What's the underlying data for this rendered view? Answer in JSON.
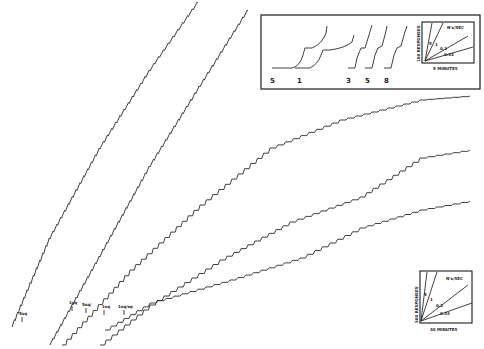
{
  "chart_data": {
    "type": "line",
    "title": "",
    "main_records": {
      "series": [
        {
          "name": "5",
          "label": "5 sq",
          "points": [
            [
              12,
              327
            ],
            [
              50,
              238
            ],
            [
              100,
              148
            ],
            [
              150,
              70
            ],
            [
              198,
              2
            ]
          ]
        },
        {
          "name": "1",
          "label": "1 sq",
          "points": [
            [
              50,
              345
            ],
            [
              100,
              256
            ],
            [
              150,
              166
            ],
            [
              200,
              86
            ],
            [
              248,
              10
            ]
          ]
        },
        {
          "name": "0.5",
          "label": "5 sq",
          "points": [
            [
              62,
              345
            ],
            [
              130,
              270
            ],
            [
              200,
              205
            ],
            [
              270,
              148
            ],
            [
              340,
              120
            ],
            [
              420,
              100
            ],
            [
              470,
              96
            ]
          ]
        },
        {
          "name": "0.1",
          "label": "1 sq",
          "points": [
            [
              100,
              345
            ],
            [
              150,
              305
            ],
            [
              220,
              260
            ],
            [
              290,
              222
            ],
            [
              360,
              197
            ],
            [
              420,
              158
            ],
            [
              470,
              150
            ]
          ]
        },
        {
          "name": "0.03",
          "label": "1 sq/msg",
          "points": [
            [
              105,
              330
            ],
            [
              150,
              303
            ],
            [
              230,
              280
            ],
            [
              300,
              258
            ],
            [
              360,
              228
            ],
            [
              420,
              210
            ],
            [
              470,
              201
            ]
          ]
        }
      ]
    },
    "labels": {
      "left_markers": [
        "5sq",
        "1sq",
        "5sq/",
        "1sq",
        "1sq/sq"
      ]
    },
    "top_inset": {
      "record_labels": [
        "5",
        "1",
        "3",
        "5",
        "8"
      ],
      "scale_key": {
        "y_label": "100 RESPONSES",
        "x_label": "5 MINUTES",
        "rate_label": "N's/SEC",
        "line_labels": [
          "5",
          "1",
          "0.1",
          "0.33"
        ]
      }
    },
    "bottom_inset": {
      "y_label": "500 RESPONSES",
      "x_label": "30 MINUTES",
      "rate_label": "N's/SEC",
      "line_labels": [
        "5",
        "1",
        "0.1",
        "0.33"
      ]
    }
  }
}
